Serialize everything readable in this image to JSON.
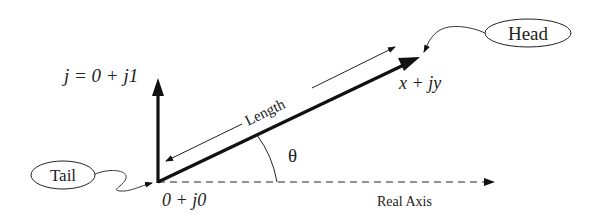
{
  "diagram": {
    "labels": {
      "imag_unit": "j = 0 + j1",
      "head_point": "x + jy",
      "origin": "0 + j0",
      "real_axis": "Real Axis",
      "length": "Length",
      "angle": "θ",
      "tail_callout": "Tail",
      "head_callout": "Head"
    },
    "colors": {
      "ink": "#111111",
      "background": "#ffffff"
    }
  }
}
